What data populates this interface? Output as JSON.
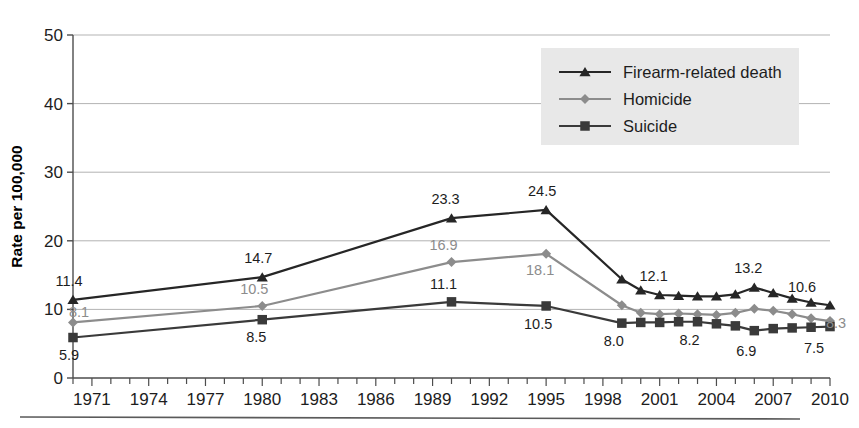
{
  "chart_data": {
    "type": "line",
    "title": "",
    "xlabel": "",
    "ylabel": "Rate per 100,000",
    "ylim": [
      0,
      50
    ],
    "yticks": [
      0,
      10,
      20,
      30,
      40,
      50
    ],
    "xlim": [
      1970,
      2010
    ],
    "xticks": [
      1971,
      1974,
      1977,
      1980,
      1983,
      1986,
      1989,
      1992,
      1995,
      1998,
      2001,
      2004,
      2007,
      2010
    ],
    "xtick_labels": [
      "1971",
      "1974",
      "1977",
      "1980",
      "1983",
      "1986",
      "1989",
      "1992",
      "1995",
      "1998",
      "2001",
      "2004",
      "2007",
      "2010"
    ],
    "grid": "horizontal",
    "legend_position": "top-right",
    "x": [
      1970,
      1980,
      1990,
      1995,
      1999,
      2000,
      2001,
      2002,
      2003,
      2004,
      2005,
      2006,
      2007,
      2008,
      2009,
      2010
    ],
    "series": [
      {
        "name": "Firearm-related death",
        "marker": "triangle",
        "color": "#262626",
        "values": [
          11.4,
          14.7,
          23.3,
          24.5,
          14.4,
          12.8,
          12.1,
          12.0,
          11.9,
          11.9,
          12.2,
          13.2,
          12.4,
          11.6,
          11.0,
          10.6
        ]
      },
      {
        "name": "Homicide",
        "marker": "diamond",
        "color": "#8c8c8c",
        "values": [
          8.1,
          10.5,
          16.9,
          18.1,
          10.6,
          9.5,
          9.3,
          9.4,
          9.3,
          9.2,
          9.5,
          10.1,
          9.8,
          9.3,
          8.7,
          8.3
        ]
      },
      {
        "name": "Suicide",
        "marker": "square",
        "color": "#3a3a3a",
        "values": [
          5.9,
          8.5,
          11.1,
          10.5,
          8.0,
          8.1,
          8.1,
          8.2,
          8.2,
          7.9,
          7.6,
          6.9,
          7.2,
          7.3,
          7.4,
          7.5
        ]
      }
    ],
    "point_labels": [
      {
        "series": "Firearm-related death",
        "x": 1970,
        "value": "11.4",
        "style": "dark",
        "dx": -4,
        "dy": -14
      },
      {
        "series": "Firearm-related death",
        "x": 1980,
        "value": "14.7",
        "style": "dark",
        "dx": -4,
        "dy": -14
      },
      {
        "series": "Firearm-related death",
        "x": 1990,
        "value": "23.3",
        "style": "dark",
        "dx": -6,
        "dy": -14
      },
      {
        "series": "Firearm-related death",
        "x": 1995,
        "value": "24.5",
        "style": "dark",
        "dx": -4,
        "dy": -14
      },
      {
        "series": "Firearm-related death",
        "x": 2001,
        "value": "12.1",
        "style": "dark",
        "dx": -6,
        "dy": -14
      },
      {
        "series": "Firearm-related death",
        "x": 2006,
        "value": "13.2",
        "style": "dark",
        "dx": -6,
        "dy": -14
      },
      {
        "series": "Firearm-related death",
        "x": 2010,
        "value": "10.6",
        "style": "dark",
        "dx": -28,
        "dy": -13
      },
      {
        "series": "Homicide",
        "x": 1970,
        "value": "8.1",
        "style": "gray",
        "dx": 6,
        "dy": -5
      },
      {
        "series": "Homicide",
        "x": 1980,
        "value": "10.5",
        "style": "gray",
        "dx": -8,
        "dy": -12
      },
      {
        "series": "Homicide",
        "x": 1990,
        "value": "16.9",
        "style": "gray",
        "dx": -8,
        "dy": -12
      },
      {
        "series": "Homicide",
        "x": 1995,
        "value": "18.1",
        "style": "gray",
        "dx": -6,
        "dy": 21
      },
      {
        "series": "Homicide",
        "x": 2010,
        "value": "8.3",
        "style": "gray",
        "dx": 6,
        "dy": 7
      },
      {
        "series": "Suicide",
        "x": 1970,
        "value": "5.9",
        "style": "dark",
        "dx": -4,
        "dy": 22
      },
      {
        "series": "Suicide",
        "x": 1980,
        "value": "8.5",
        "style": "dark",
        "dx": -6,
        "dy": 22
      },
      {
        "series": "Suicide",
        "x": 1990,
        "value": "11.1",
        "style": "dark",
        "dx": -8,
        "dy": -13
      },
      {
        "series": "Suicide",
        "x": 1995,
        "value": "10.5",
        "style": "dark",
        "dx": -8,
        "dy": 23
      },
      {
        "series": "Suicide",
        "x": 1999,
        "value": "8.0",
        "style": "dark",
        "dx": -8,
        "dy": 23
      },
      {
        "series": "Suicide",
        "x": 2003,
        "value": "8.2",
        "style": "dark",
        "dx": -8,
        "dy": 23
      },
      {
        "series": "Suicide",
        "x": 2006,
        "value": "6.9",
        "style": "dark",
        "dx": -8,
        "dy": 25
      },
      {
        "series": "Suicide",
        "x": 2010,
        "value": "7.5",
        "style": "dark",
        "dx": -16,
        "dy": 26
      }
    ]
  },
  "legend": {
    "items": [
      {
        "label": "Firearm-related death",
        "marker": "triangle-icon",
        "color": "#262626"
      },
      {
        "label": "Homicide",
        "marker": "diamond-icon",
        "color": "#8c8c8c"
      },
      {
        "label": "Suicide",
        "marker": "square-icon",
        "color": "#3a3a3a"
      }
    ],
    "background": "#e8e8e8"
  },
  "colors": {
    "axis": "#4d4d4d",
    "grid": "#b3b3b3",
    "firearm": "#262626",
    "homicide": "#8c8c8c",
    "suicide": "#3a3a3a",
    "footer_rule": "#5a5a5a"
  }
}
